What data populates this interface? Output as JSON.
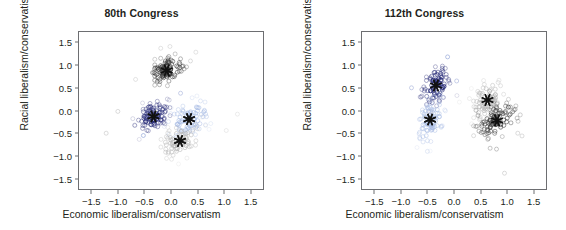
{
  "figure": {
    "background": "#ffffff",
    "axis_color": "#6d6e71",
    "text_color": "#231f20"
  },
  "axis_labels": {
    "x": "Economic liberalism/conservatism",
    "y": "Racial liberalism/conservatism"
  },
  "ticks": {
    "x": [
      "−1.5",
      "−1.0",
      "−0.5",
      "0.0",
      "0.5",
      "1.0",
      "1.5"
    ],
    "y": [
      "1.5",
      "1.0",
      "0.5",
      "0.0",
      "−0.5",
      "−1.0",
      "−1.5"
    ],
    "x_values": [
      -1.5,
      -1.0,
      -0.5,
      0.0,
      0.5,
      1.0,
      1.5
    ],
    "y_values": [
      1.5,
      1.0,
      0.5,
      0.0,
      -0.5,
      -1.0,
      -1.5
    ]
  },
  "colors": {
    "dark_blue": "#2b2f7a",
    "light_blue": "#a8bce4",
    "dark_gray": "#3a3a3a",
    "light_gray": "#b5b5b5",
    "centroid": "#111111"
  },
  "chart_data": [
    {
      "type": "scatter",
      "title": "80th Congress",
      "xlabel": "Economic liberalism/conservatism",
      "ylabel": "Racial liberalism/conservatism",
      "xlim": [
        -1.75,
        1.75
      ],
      "ylim": [
        -1.75,
        1.75
      ],
      "grid": false,
      "legend": "none",
      "marker": "open-circle",
      "centroid_marker": "asterisk",
      "series": [
        {
          "name": "cluster-dark-gray",
          "color": "#3a3a3a",
          "centroid": [
            -0.08,
            0.88
          ],
          "n": 96,
          "spread": [
            0.17,
            0.15
          ],
          "seed": 11
        },
        {
          "name": "cluster-dark-blue",
          "color": "#2b2f7a",
          "centroid": [
            -0.33,
            -0.13
          ],
          "n": 92,
          "spread": [
            0.15,
            0.16
          ],
          "seed": 23
        },
        {
          "name": "cluster-light-blue",
          "color": "#a8bce4",
          "centroid": [
            0.34,
            -0.19
          ],
          "n": 84,
          "spread": [
            0.19,
            0.19
          ],
          "seed": 37
        },
        {
          "name": "cluster-light-gray",
          "color": "#b5b5b5",
          "centroid": [
            0.17,
            -0.67
          ],
          "n": 70,
          "spread": [
            0.19,
            0.17
          ],
          "seed": 53
        }
      ],
      "outliers": [
        {
          "x": -1.0,
          "y": -0.02,
          "color": "#b5b5b5"
        },
        {
          "x": -1.22,
          "y": -0.5,
          "color": "#b5b5b5"
        },
        {
          "x": -0.52,
          "y": -0.55,
          "color": "#6b85c8"
        },
        {
          "x": 0.18,
          "y": 0.38,
          "color": "#8f9fd0"
        },
        {
          "x": 1.25,
          "y": -0.08,
          "color": "#d6d6d6"
        },
        {
          "x": 1.04,
          "y": -0.44,
          "color": "#d6d6d6"
        }
      ]
    },
    {
      "type": "scatter",
      "title": "112th Congress",
      "xlabel": "Economic liberalism/conservatism",
      "ylabel": "Racial liberalism/conservatism",
      "xlim": [
        -1.75,
        1.75
      ],
      "ylim": [
        -1.75,
        1.75
      ],
      "grid": false,
      "legend": "none",
      "marker": "open-circle",
      "centroid_marker": "asterisk",
      "series": [
        {
          "name": "cluster-dark-blue",
          "color": "#2b2f7a",
          "centroid": [
            -0.34,
            0.55
          ],
          "n": 88,
          "spread": [
            0.13,
            0.21
          ],
          "seed": 7
        },
        {
          "name": "cluster-light-blue",
          "color": "#a8bce4",
          "centroid": [
            -0.45,
            -0.2
          ],
          "n": 86,
          "spread": [
            0.12,
            0.24
          ],
          "seed": 19
        },
        {
          "name": "cluster-light-gray",
          "color": "#b5b5b5",
          "centroid": [
            0.63,
            0.23
          ],
          "n": 84,
          "spread": [
            0.15,
            0.2
          ],
          "seed": 31
        },
        {
          "name": "cluster-dark-gray",
          "color": "#3a3a3a",
          "centroid": [
            0.81,
            -0.22
          ],
          "n": 90,
          "spread": [
            0.18,
            0.17
          ],
          "seed": 47
        }
      ],
      "outliers": [
        {
          "x": -0.8,
          "y": 0.5,
          "color": "#8f9fd0"
        },
        {
          "x": 0.05,
          "y": 0.65,
          "color": "#8f9fd0"
        },
        {
          "x": -0.12,
          "y": 1.18,
          "color": "#6b85c8"
        },
        {
          "x": -0.5,
          "y": -0.9,
          "color": "#c7d3ec"
        },
        {
          "x": 1.2,
          "y": -0.5,
          "color": "#b5b5b5"
        },
        {
          "x": 1.28,
          "y": -0.56,
          "color": "#b5b5b5"
        },
        {
          "x": 0.68,
          "y": -0.83,
          "color": "#8a8a8a"
        },
        {
          "x": 0.8,
          "y": -0.85,
          "color": "#8a8a8a"
        },
        {
          "x": 0.95,
          "y": -1.38,
          "color": "#b5b5b5"
        }
      ]
    }
  ]
}
